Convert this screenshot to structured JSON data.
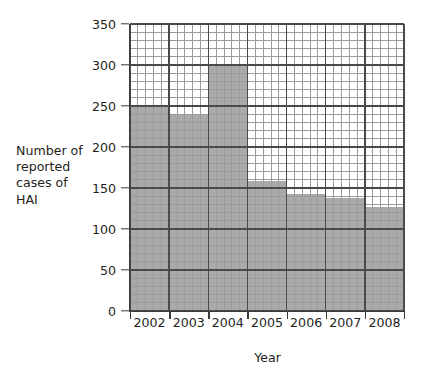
{
  "chart_data": {
    "type": "bar",
    "title": "",
    "subtitle": "",
    "xlabel": "Year",
    "ylabel": "Number of reported cases of HAI",
    "ylabel_lines": [
      "Number of",
      "reported",
      "cases of",
      "HAI"
    ],
    "categories": [
      "2002",
      "2003",
      "2004",
      "2005",
      "2006",
      "2007",
      "2008"
    ],
    "values": [
      250,
      240,
      300,
      158,
      143,
      138,
      127
    ],
    "ylim": [
      0,
      350
    ],
    "xlim_note": "contiguous bars, one per year, no gaps",
    "y_ticks": [
      0,
      50,
      100,
      150,
      200,
      250,
      300,
      350
    ],
    "y_tick_labels": [
      "0",
      "50",
      "100",
      "150",
      "200",
      "250",
      "300",
      "350"
    ],
    "x_tick_labels": [
      "2002",
      "2003",
      "2004",
      "2005",
      "2006",
      "2007",
      "2008"
    ],
    "grid": {
      "major_enabled": true,
      "minor_enabled": true,
      "minor_step_y": 10,
      "major_step_y": 50,
      "minor_per_category_x": 5,
      "orientation": "both"
    },
    "legend": {
      "present": false,
      "position": "none",
      "entries": []
    },
    "annotations": [],
    "colors": {
      "bar_fill": "#a9a9a9",
      "grid_major": "#4a4a4a",
      "grid_minor": "#9a9a9a",
      "axis": "#3a3a3a",
      "text": "#231f20",
      "background": "#ffffff"
    }
  },
  "axes": {
    "y_title_block": "Number of\nreported\ncases of\nHAI",
    "x_title": "Year"
  }
}
